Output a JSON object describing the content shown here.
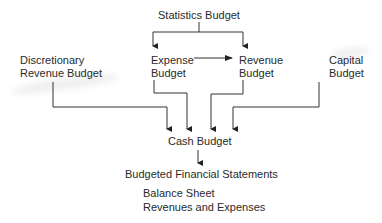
{
  "diagram": {
    "nodes": {
      "statistics": "Statistics Budget",
      "discretionary_line1": "Discretionary",
      "discretionary_line2": "Revenue Budget",
      "expense_line1": "Expense",
      "expense_line2": "Budget",
      "revenue_line1": "Revenue",
      "revenue_line2": "Budget",
      "capital_line1": "Capital",
      "capital_line2": "Budget",
      "cash": "Cash Budget",
      "financial_statements": "Budgeted Financial Statements",
      "balance_sheet": "Balance Sheet",
      "revenues_expenses": "Revenues and Expenses"
    },
    "edges": [
      {
        "from": "Statistics Budget",
        "to": "Expense Budget"
      },
      {
        "from": "Statistics Budget",
        "to": "Revenue Budget"
      },
      {
        "from": "Expense Budget",
        "to": "Revenue Budget"
      },
      {
        "from": "Discretionary Revenue Budget",
        "to": "Cash Budget"
      },
      {
        "from": "Expense Budget",
        "to": "Cash Budget"
      },
      {
        "from": "Revenue Budget",
        "to": "Cash Budget"
      },
      {
        "from": "Capital Budget",
        "to": "Cash Budget"
      },
      {
        "from": "Cash Budget",
        "to": "Budgeted Financial Statements"
      }
    ],
    "line_color": "#333333"
  }
}
